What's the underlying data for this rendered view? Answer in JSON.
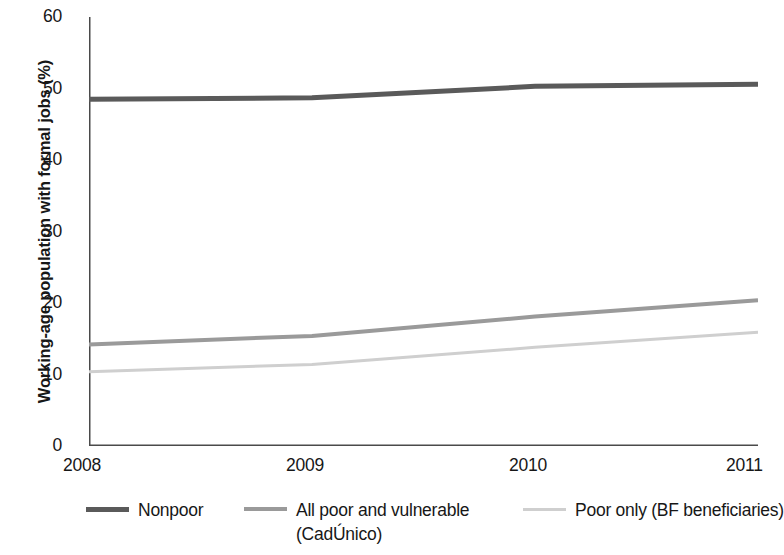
{
  "chart_data": {
    "type": "line",
    "title": "",
    "subtitle": "",
    "xlabel": "",
    "ylabel": "Working-age population with formal jobs (%)",
    "x": [
      2008,
      2009,
      2010,
      2011
    ],
    "categories": [
      "2008",
      "2009",
      "2010",
      "2011"
    ],
    "xlim": [
      2008,
      2011
    ],
    "ylim": [
      0,
      60
    ],
    "yticks": [
      0,
      10,
      20,
      30,
      40,
      50,
      60
    ],
    "ytick_labels": [
      "0",
      "10",
      "20",
      "30",
      "40",
      "50",
      "60"
    ],
    "xtick_labels": [
      "2008",
      "2009",
      "2010",
      "2011"
    ],
    "grid": false,
    "legend_position": "below",
    "series": [
      {
        "name": "Nonpoor",
        "values": [
          48.5,
          48.7,
          50.3,
          50.6
        ],
        "color": "#5a5a5a",
        "line_width": 5
      },
      {
        "name": "All poor and vulnerable (CadÚnico)",
        "values": [
          14.2,
          15.4,
          18.1,
          20.4
        ],
        "color": "#9a9a9a",
        "line_width": 4
      },
      {
        "name": "Poor only (BF beneficiaries)",
        "values": [
          10.4,
          11.4,
          13.8,
          15.9
        ],
        "color": "#cfcfcf",
        "line_width": 3
      }
    ]
  },
  "axis": {
    "line_color": "#4a4a4a",
    "tick_length": 8
  },
  "legend": {
    "entries": [
      {
        "label": "Nonpoor",
        "color": "#5a5a5a",
        "swatch": "legend-line-nonpoor"
      },
      {
        "label": "All poor and vulnerable (CadÚnico)",
        "color": "#9a9a9a",
        "swatch": "legend-line-all-poor"
      },
      {
        "label": "Poor only (BF beneficiaries)",
        "color": "#cfcfcf",
        "swatch": "legend-line-poor-only"
      }
    ]
  }
}
